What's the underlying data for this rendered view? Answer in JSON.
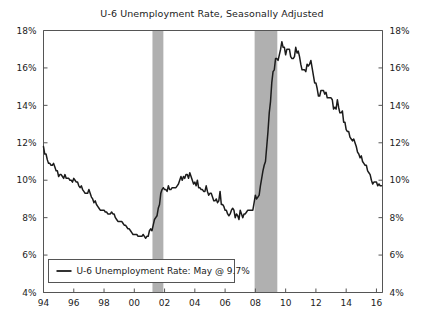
{
  "chart_data": {
    "type": "line",
    "title": "U-6 Unemployment Rate, Seasonally Adjusted",
    "xlabel": "",
    "ylabel": "",
    "ylim": [
      4,
      18
    ],
    "xlim": [
      1994.0,
      2016.4
    ],
    "y_tick_labels": [
      "4%",
      "6%",
      "8%",
      "10%",
      "12%",
      "14%",
      "16%",
      "18%"
    ],
    "y_ticks": [
      4,
      6,
      8,
      10,
      12,
      14,
      16,
      18
    ],
    "x_tick_labels": [
      "94",
      "96",
      "98",
      "00",
      "02",
      "04",
      "06",
      "08",
      "10",
      "12",
      "14",
      "16"
    ],
    "x_ticks": [
      1994,
      1996,
      1998,
      2000,
      2002,
      2004,
      2006,
      2008,
      2010,
      2012,
      2014,
      2016
    ],
    "grid": false,
    "dual_y_axis": true,
    "legend_position": "lower-left",
    "legend_entries": [
      "U-6 Unemployment Rate: May @ 9.7%"
    ],
    "series": [
      {
        "name": "U-6 Unemployment Rate: May @ 9.7%",
        "color": "#1b1b1b",
        "last_value": 9.7,
        "last_label": "May @ 9.7%",
        "x": [
          1994.0,
          1994.083,
          1994.167,
          1994.25,
          1994.333,
          1994.417,
          1994.5,
          1994.583,
          1994.667,
          1994.75,
          1994.833,
          1994.917,
          1995.0,
          1995.083,
          1995.167,
          1995.25,
          1995.333,
          1995.417,
          1995.5,
          1995.583,
          1995.667,
          1995.75,
          1995.833,
          1995.917,
          1996.0,
          1996.083,
          1996.167,
          1996.25,
          1996.333,
          1996.417,
          1996.5,
          1996.583,
          1996.667,
          1996.75,
          1996.833,
          1996.917,
          1997.0,
          1997.083,
          1997.167,
          1997.25,
          1997.333,
          1997.417,
          1997.5,
          1997.583,
          1997.667,
          1997.75,
          1997.833,
          1997.917,
          1998.0,
          1998.083,
          1998.167,
          1998.25,
          1998.333,
          1998.417,
          1998.5,
          1998.583,
          1998.667,
          1998.75,
          1998.833,
          1998.917,
          1999.0,
          1999.083,
          1999.167,
          1999.25,
          1999.333,
          1999.417,
          1999.5,
          1999.583,
          1999.667,
          1999.75,
          1999.833,
          1999.917,
          2000.0,
          2000.083,
          2000.167,
          2000.25,
          2000.333,
          2000.417,
          2000.5,
          2000.583,
          2000.667,
          2000.75,
          2000.833,
          2000.917,
          2001.0,
          2001.083,
          2001.167,
          2001.25,
          2001.333,
          2001.417,
          2001.5,
          2001.583,
          2001.667,
          2001.75,
          2001.833,
          2001.917,
          2002.0,
          2002.083,
          2002.167,
          2002.25,
          2002.333,
          2002.417,
          2002.5,
          2002.583,
          2002.667,
          2002.75,
          2002.833,
          2002.917,
          2003.0,
          2003.083,
          2003.167,
          2003.25,
          2003.333,
          2003.417,
          2003.5,
          2003.583,
          2003.667,
          2003.75,
          2003.833,
          2003.917,
          2004.0,
          2004.083,
          2004.167,
          2004.25,
          2004.333,
          2004.417,
          2004.5,
          2004.583,
          2004.667,
          2004.75,
          2004.833,
          2004.917,
          2005.0,
          2005.083,
          2005.167,
          2005.25,
          2005.333,
          2005.417,
          2005.5,
          2005.583,
          2005.667,
          2005.75,
          2005.833,
          2005.917,
          2006.0,
          2006.083,
          2006.167,
          2006.25,
          2006.333,
          2006.417,
          2006.5,
          2006.583,
          2006.667,
          2006.75,
          2006.833,
          2006.917,
          2007.0,
          2007.083,
          2007.167,
          2007.25,
          2007.333,
          2007.417,
          2007.5,
          2007.583,
          2007.667,
          2007.75,
          2007.833,
          2007.917,
          2008.0,
          2008.083,
          2008.167,
          2008.25,
          2008.333,
          2008.417,
          2008.5,
          2008.583,
          2008.667,
          2008.75,
          2008.833,
          2008.917,
          2009.0,
          2009.083,
          2009.167,
          2009.25,
          2009.333,
          2009.417,
          2009.5,
          2009.583,
          2009.667,
          2009.75,
          2009.833,
          2009.917,
          2010.0,
          2010.083,
          2010.167,
          2010.25,
          2010.333,
          2010.417,
          2010.5,
          2010.583,
          2010.667,
          2010.75,
          2010.833,
          2010.917,
          2011.0,
          2011.083,
          2011.167,
          2011.25,
          2011.333,
          2011.417,
          2011.5,
          2011.583,
          2011.667,
          2011.75,
          2011.833,
          2011.917,
          2012.0,
          2012.083,
          2012.167,
          2012.25,
          2012.333,
          2012.417,
          2012.5,
          2012.583,
          2012.667,
          2012.75,
          2012.833,
          2012.917,
          2013.0,
          2013.083,
          2013.167,
          2013.25,
          2013.333,
          2013.417,
          2013.5,
          2013.583,
          2013.667,
          2013.75,
          2013.833,
          2013.917,
          2014.0,
          2014.083,
          2014.167,
          2014.25,
          2014.333,
          2014.417,
          2014.5,
          2014.583,
          2014.667,
          2014.75,
          2014.833,
          2014.917,
          2015.0,
          2015.083,
          2015.167,
          2015.25,
          2015.333,
          2015.417,
          2015.5,
          2015.583,
          2015.667,
          2015.75,
          2015.833,
          2015.917,
          2016.0,
          2016.083,
          2016.167,
          2016.25,
          2016.333
        ],
        "values": [
          11.8,
          11.4,
          11.4,
          11.1,
          10.9,
          10.9,
          10.8,
          10.8,
          10.9,
          10.7,
          10.5,
          10.5,
          10.2,
          10.3,
          10.3,
          10.2,
          10.1,
          10.3,
          10.1,
          10.1,
          10.1,
          10.0,
          10.0,
          9.9,
          10.1,
          10.0,
          9.9,
          9.9,
          9.7,
          9.6,
          9.7,
          9.5,
          9.4,
          9.3,
          9.3,
          9.3,
          9.5,
          9.3,
          9.1,
          9.0,
          8.8,
          8.9,
          8.7,
          8.6,
          8.5,
          8.4,
          8.4,
          8.4,
          8.4,
          8.3,
          8.3,
          8.2,
          8.2,
          8.2,
          8.3,
          8.2,
          8.2,
          8.0,
          7.9,
          7.8,
          7.8,
          7.8,
          7.8,
          7.7,
          7.6,
          7.6,
          7.5,
          7.4,
          7.4,
          7.3,
          7.2,
          7.1,
          7.1,
          7.1,
          7.1,
          7.0,
          7.0,
          7.0,
          7.0,
          7.1,
          7.0,
          6.9,
          7.0,
          7.0,
          7.3,
          7.4,
          7.3,
          7.6,
          7.9,
          8.0,
          8.1,
          8.5,
          8.7,
          9.3,
          9.5,
          9.6,
          9.5,
          9.5,
          9.4,
          9.7,
          9.5,
          9.5,
          9.6,
          9.6,
          9.6,
          9.6,
          9.7,
          9.8,
          10.0,
          10.2,
          10.0,
          10.2,
          10.1,
          10.3,
          10.3,
          10.1,
          10.4,
          10.2,
          10.0,
          9.8,
          9.9,
          9.7,
          10.0,
          9.6,
          9.6,
          9.5,
          9.5,
          9.4,
          9.4,
          9.7,
          9.4,
          9.2,
          9.3,
          9.3,
          9.1,
          8.9,
          8.9,
          9.0,
          8.8,
          8.9,
          9.4,
          8.7,
          8.7,
          8.6,
          8.4,
          8.4,
          8.2,
          8.1,
          8.2,
          8.4,
          8.5,
          8.4,
          8.0,
          8.2,
          8.1,
          7.9,
          8.4,
          8.2,
          8.0,
          8.2,
          8.2,
          8.3,
          8.4,
          8.4,
          8.4,
          8.4,
          8.4,
          8.8,
          9.2,
          9.0,
          9.1,
          9.2,
          9.7,
          10.1,
          10.5,
          10.8,
          11.0,
          11.8,
          12.6,
          13.6,
          14.2,
          15.2,
          15.8,
          15.9,
          16.5,
          16.5,
          16.4,
          16.7,
          17.0,
          17.4,
          17.1,
          17.1,
          16.7,
          17.0,
          17.0,
          17.0,
          16.6,
          16.5,
          16.5,
          16.6,
          17.1,
          16.8,
          16.9,
          16.6,
          16.2,
          15.9,
          15.9,
          15.9,
          15.8,
          16.2,
          16.1,
          16.2,
          16.4,
          16.0,
          15.6,
          15.2,
          15.2,
          14.9,
          14.5,
          14.5,
          14.8,
          14.8,
          14.8,
          14.6,
          14.7,
          14.4,
          14.4,
          14.4,
          14.4,
          14.3,
          13.8,
          13.9,
          13.8,
          14.3,
          13.9,
          13.6,
          13.6,
          13.7,
          13.1,
          13.1,
          12.7,
          12.6,
          12.6,
          12.3,
          12.2,
          12.1,
          12.2,
          12.0,
          11.8,
          11.5,
          11.4,
          11.2,
          11.3,
          11.0,
          10.9,
          10.8,
          10.8,
          10.5,
          10.4,
          10.3,
          10.0,
          9.8,
          9.9,
          9.9,
          9.9,
          9.7,
          9.8,
          9.7,
          9.7
        ]
      }
    ],
    "shaded_regions": [
      {
        "label": "recession-2001",
        "start": 2001.2,
        "end": 2001.92,
        "color": "#b0b0b0"
      },
      {
        "label": "recession-2008",
        "start": 2007.95,
        "end": 2009.45,
        "color": "#b0b0b0"
      }
    ]
  }
}
